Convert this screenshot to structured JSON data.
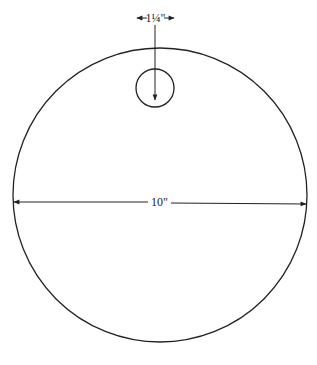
{
  "diagram": {
    "type": "dimensioned-circle",
    "large_circle": {
      "diameter_label": "10\"",
      "cx": 160,
      "cy": 195,
      "r": 147
    },
    "small_circle": {
      "diameter_label": "1¼\"",
      "cx": 155,
      "cy": 88,
      "r": 19
    },
    "colors": {
      "stroke": "#222222",
      "background": "#ffffff"
    }
  }
}
